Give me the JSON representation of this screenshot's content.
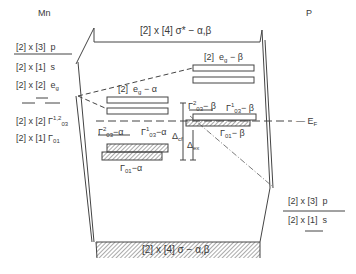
{
  "diagram": {
    "left_atom": "Mn",
    "right_atom": "P",
    "fermi_label": "E",
    "fermi_sub": "F",
    "sigma_star": {
      "count": "2",
      "mult": "4",
      "text": "σ* − α,β"
    },
    "sigma": {
      "count": "2",
      "mult": "4",
      "text": "σ − α,β"
    },
    "mn_levels": [
      {
        "count": "2",
        "mult": "3",
        "name": "p"
      },
      {
        "count": "2",
        "mult": "1",
        "name": "s"
      },
      {
        "count": "2",
        "mult": "2",
        "name": "e",
        "sub": "g"
      },
      {
        "count": "2",
        "mult": "2",
        "name": "Γ",
        "sub": "03",
        "sup": "1,2"
      },
      {
        "count": "2",
        "mult": "1",
        "name": "Γ",
        "sub": "01"
      }
    ],
    "p_levels": [
      {
        "count": "2",
        "mult": "3",
        "name": "p"
      },
      {
        "count": "2",
        "mult": "1",
        "name": "s"
      }
    ],
    "bands": {
      "eg_alpha": {
        "count": "2",
        "name": "e",
        "sub": "g",
        "spin": "− α"
      },
      "eg_beta": {
        "count": "2",
        "name": "e",
        "sub": "g",
        "spin": "− β"
      },
      "g03_2_alpha": {
        "name": "Γ",
        "sub": "03",
        "sup": "2",
        "spin": "−α"
      },
      "g03_1_alpha": {
        "name": "Γ",
        "sub": "03",
        "sup": "1",
        "spin": "−α"
      },
      "g01_alpha": {
        "name": "Γ",
        "sub": "01",
        "spin": "−α"
      },
      "g03_2_beta": {
        "name": "Γ",
        "sub": "03",
        "sup": "2",
        "spin": "− β"
      },
      "g03_1_beta": {
        "name": "Γ",
        "sub": "03",
        "sup": "1",
        "spin": "− β"
      },
      "g01_beta": {
        "name": "Γ",
        "sub": "01",
        "spin": "− β"
      }
    },
    "deltas": {
      "cf": {
        "name": "Δ",
        "sub": "cf"
      },
      "ex": {
        "name": "Δ",
        "sub": "ex"
      }
    }
  }
}
